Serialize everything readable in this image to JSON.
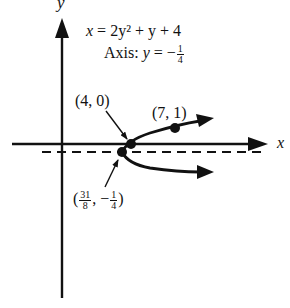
{
  "figure": {
    "partial_label": "26.",
    "y_axis_label": "y",
    "x_axis_label": "x",
    "equation": {
      "lhs": "x",
      "eq": "=",
      "rhs": "2y² + y + 4"
    },
    "axis_line": {
      "prefix": "Axis:",
      "var": "y",
      "eq": "= −",
      "frac_num": "1",
      "frac_den": "4"
    },
    "points": [
      {
        "label": "(4, 0)",
        "x": 4,
        "y": 0
      },
      {
        "label": "(7, 1)",
        "x": 7,
        "y": 1
      },
      {
        "label_open": "(",
        "frac1_num": "31",
        "frac1_den": "8",
        "mid": ", −",
        "frac2_num": "1",
        "frac2_den": "4",
        "label_close": ")",
        "x": 3.875,
        "y": -0.25,
        "role": "vertex"
      }
    ],
    "colors": {
      "ink": "#111111",
      "background": "#ffffff"
    }
  }
}
